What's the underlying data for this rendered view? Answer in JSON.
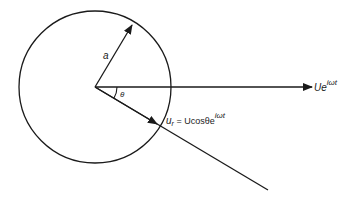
{
  "diagram": {
    "labels": {
      "radius": "a",
      "angle": "θ",
      "free_stream": "Ue",
      "free_stream_exp": "iωt",
      "radial_lhs": "u",
      "radial_sub": "r",
      "radial_rhs": " = Ucosθe",
      "radial_exp": "iωt"
    },
    "colors": {
      "stroke": "#1a1a1a",
      "background": "#ffffff"
    }
  }
}
